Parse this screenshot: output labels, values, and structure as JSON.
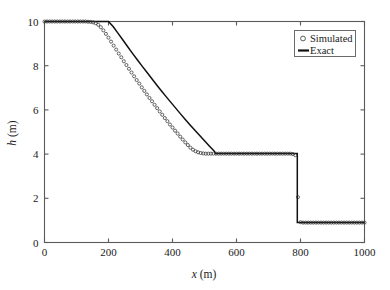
{
  "chart_data": {
    "type": "line",
    "title": "",
    "subtitle": "",
    "xlabel": "x (m)",
    "xlabel_italic_part": "x",
    "xlabel_rest": " (m)",
    "ylabel": "h (m)",
    "ylabel_italic_part": "h",
    "ylabel_rest": " (m)",
    "xlim": [
      0,
      1000
    ],
    "ylim": [
      0,
      10
    ],
    "xticks": [
      0,
      200,
      400,
      600,
      800,
      1000
    ],
    "yticks": [
      0,
      2,
      4,
      6,
      8,
      10
    ],
    "xtick_labels": [
      "0",
      "200",
      "400",
      "600",
      "800",
      "1000"
    ],
    "ytick_labels": [
      "0",
      "2",
      "4",
      "6",
      "8",
      "10"
    ],
    "grid": false,
    "legend_position": "top-right",
    "background_color": "#ffffff",
    "axis_color": "#5a5a5a",
    "series": [
      {
        "name": "Exact",
        "style": "solid-line",
        "color": "#111111",
        "x": [
          0,
          20,
          40,
          60,
          80,
          100,
          120,
          140,
          160,
          180,
          200,
          215,
          230,
          245,
          260,
          275,
          290,
          305,
          320,
          335,
          350,
          365,
          380,
          395,
          410,
          425,
          440,
          455,
          470,
          485,
          500,
          515,
          530,
          535,
          560,
          600,
          640,
          680,
          720,
          760,
          790,
          790,
          800,
          840,
          880,
          920,
          960,
          1000
        ],
        "y": [
          10.0,
          10.0,
          10.0,
          10.0,
          10.0,
          10.0,
          10.0,
          10.0,
          10.0,
          10.0,
          10.0,
          9.76,
          9.46,
          9.16,
          8.86,
          8.56,
          8.27,
          7.98,
          7.7,
          7.42,
          7.14,
          6.87,
          6.6,
          6.34,
          6.08,
          5.82,
          5.57,
          5.32,
          5.08,
          4.84,
          4.6,
          4.37,
          4.14,
          4.03,
          4.03,
          4.03,
          4.03,
          4.03,
          4.03,
          4.03,
          4.03,
          0.9,
          0.9,
          0.9,
          0.9,
          0.9,
          0.9,
          0.9
        ]
      },
      {
        "name": "Simulated",
        "style": "open-circle-markers",
        "color": "#333333",
        "marker": "circle",
        "marker_size_px": 3.1,
        "x": [
          0,
          8,
          16,
          24,
          32,
          40,
          48,
          56,
          64,
          72,
          80,
          88,
          96,
          104,
          112,
          120,
          128,
          136,
          144,
          152,
          160,
          168,
          176,
          184,
          192,
          200,
          208,
          216,
          224,
          232,
          240,
          248,
          256,
          264,
          272,
          280,
          288,
          296,
          304,
          312,
          320,
          328,
          336,
          344,
          352,
          360,
          368,
          376,
          384,
          392,
          400,
          408,
          416,
          424,
          432,
          440,
          448,
          456,
          464,
          472,
          480,
          488,
          496,
          504,
          512,
          520,
          528,
          536,
          544,
          552,
          560,
          568,
          576,
          584,
          592,
          600,
          608,
          616,
          624,
          632,
          640,
          648,
          656,
          664,
          672,
          680,
          688,
          696,
          704,
          712,
          720,
          728,
          736,
          744,
          752,
          760,
          768,
          776,
          784,
          792,
          800,
          808,
          816,
          824,
          832,
          840,
          848,
          856,
          864,
          872,
          880,
          888,
          896,
          904,
          912,
          920,
          928,
          936,
          944,
          952,
          960,
          968,
          976,
          984,
          992,
          1000
        ],
        "y": [
          10.0,
          10.0,
          10.0,
          10.0,
          10.0,
          10.0,
          10.0,
          10.0,
          10.0,
          10.0,
          10.0,
          10.0,
          10.0,
          10.0,
          10.0,
          10.0,
          10.0,
          9.99,
          9.98,
          9.96,
          9.92,
          9.85,
          9.74,
          9.6,
          9.44,
          9.27,
          9.09,
          8.91,
          8.73,
          8.55,
          8.38,
          8.2,
          8.03,
          7.86,
          7.69,
          7.52,
          7.35,
          7.19,
          7.02,
          6.86,
          6.7,
          6.54,
          6.39,
          6.23,
          6.08,
          5.93,
          5.78,
          5.63,
          5.49,
          5.34,
          5.2,
          5.06,
          4.93,
          4.79,
          4.66,
          4.53,
          4.41,
          4.29,
          4.2,
          4.13,
          4.08,
          4.05,
          4.03,
          4.02,
          4.02,
          4.02,
          4.02,
          4.02,
          4.02,
          4.02,
          4.02,
          4.02,
          4.02,
          4.02,
          4.02,
          4.02,
          4.02,
          4.02,
          4.02,
          4.02,
          4.02,
          4.02,
          4.02,
          4.02,
          4.02,
          4.02,
          4.02,
          4.02,
          4.02,
          4.02,
          4.02,
          4.02,
          4.02,
          4.02,
          4.02,
          4.02,
          4.02,
          4.0,
          3.95,
          2.05,
          0.92,
          0.9,
          0.9,
          0.9,
          0.9,
          0.9,
          0.9,
          0.9,
          0.9,
          0.9,
          0.9,
          0.9,
          0.9,
          0.9,
          0.9,
          0.9,
          0.9,
          0.9,
          0.9,
          0.9,
          0.9,
          0.9,
          0.9,
          0.9,
          0.9,
          0.9
        ]
      }
    ],
    "annotations": {
      "upstream_depth": 10.0,
      "plateau_depth": 4.03,
      "downstream_depth": 0.9,
      "rarefaction_head_x": 200,
      "rarefaction_tail_x": 535,
      "shock_x": 790
    }
  },
  "legend": {
    "entries": [
      {
        "label": "Simulated",
        "symbol": "circle"
      },
      {
        "label": "Exact",
        "symbol": "line"
      }
    ]
  }
}
